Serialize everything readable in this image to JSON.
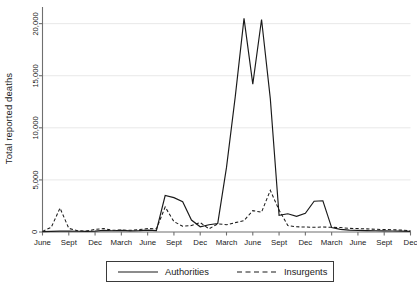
{
  "chart_data": {
    "type": "line",
    "title": "",
    "xlabel": "",
    "ylabel": "Total reported deaths",
    "ylim": [
      0,
      21500
    ],
    "yticks": [
      0,
      5000,
      10000,
      15000,
      20000
    ],
    "ytick_labels": [
      "0",
      "5,000",
      "10,000",
      "15,000",
      "20,000"
    ],
    "grid": "horizontal",
    "legend_position": "bottom-center",
    "x_tick_labels": [
      "June",
      "Sept",
      "Dec",
      "March",
      "June",
      "Sept",
      "Dec",
      "March",
      "June",
      "Sept",
      "Dec",
      "March",
      "June",
      "Sept",
      "Dec"
    ],
    "x_tick_values": [
      0,
      3,
      6,
      9,
      12,
      15,
      18,
      21,
      24,
      27,
      30,
      33,
      36,
      39,
      42
    ],
    "x": [
      0,
      1,
      2,
      3,
      4,
      5,
      6,
      7,
      8,
      9,
      10,
      11,
      12,
      13,
      14,
      15,
      16,
      17,
      18,
      19,
      20,
      21,
      22,
      23,
      24,
      25,
      26,
      27,
      28,
      29,
      30,
      31,
      32,
      33,
      34,
      35,
      36,
      37,
      38,
      39,
      40,
      41,
      42
    ],
    "series": [
      {
        "name": "Authorities",
        "style": "solid",
        "color": "#1a1a1a",
        "values": [
          40,
          60,
          80,
          90,
          70,
          60,
          90,
          150,
          120,
          160,
          110,
          130,
          180,
          140,
          3500,
          3300,
          2900,
          1150,
          500,
          700,
          820,
          6200,
          13000,
          20500,
          14200,
          20400,
          12800,
          1600,
          1750,
          1500,
          1800,
          2950,
          3000,
          420,
          250,
          180,
          150,
          130,
          120,
          110,
          100,
          80,
          60
        ]
      },
      {
        "name": "Insurgents",
        "style": "dashed",
        "color": "#1a1a1a",
        "values": [
          60,
          450,
          2300,
          350,
          120,
          90,
          250,
          330,
          170,
          190,
          160,
          230,
          330,
          300,
          2400,
          1000,
          550,
          620,
          900,
          300,
          780,
          700,
          900,
          1100,
          2050,
          1900,
          4000,
          2100,
          620,
          500,
          480,
          450,
          480,
          450,
          430,
          350,
          330,
          300,
          260,
          240,
          220,
          180,
          120
        ]
      }
    ]
  },
  "legend": {
    "entries": [
      {
        "label": "Authorities",
        "style": "solid"
      },
      {
        "label": "Insurgents",
        "style": "dashed"
      }
    ]
  }
}
